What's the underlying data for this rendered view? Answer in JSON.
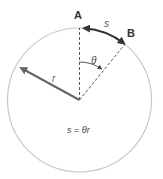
{
  "diagram": {
    "labels": {
      "point_a": "A",
      "point_b": "B",
      "arc": "s",
      "angle": "θ",
      "radius": "r",
      "formula": "s = θr"
    },
    "colors": {
      "circle": "#c8c8c8",
      "radius_arrow": "#666666",
      "arc": "#333333",
      "dashed": "#444444",
      "text": "#333333"
    }
  }
}
